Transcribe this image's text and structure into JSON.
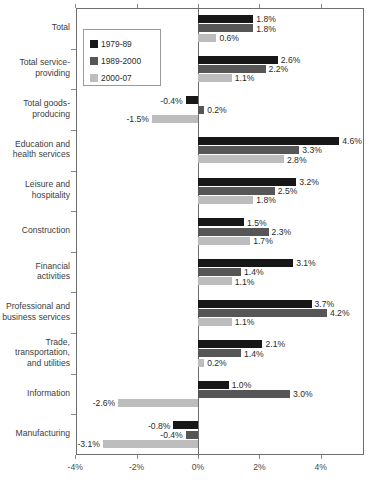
{
  "chart_data": {
    "type": "bar",
    "orientation": "horizontal",
    "title": "",
    "subtitle": "",
    "xlabel": "",
    "ylabel": "",
    "xlim": [
      -4.6,
      5.0
    ],
    "xticks": [
      -4,
      -2,
      0,
      2,
      4
    ],
    "xtick_labels": [
      "-4%",
      "-2%",
      "0%",
      "2%",
      "4%"
    ],
    "grid": false,
    "legend_position": "upper-left-inside",
    "value_suffix": "%",
    "categories": [
      "Total",
      "Total service-\nproviding",
      "Total goods-\nproducing",
      "Education and\nhealth services",
      "Leisure and\nhospitality",
      "Construction",
      "Financial\nactivities",
      "Professional and\nbusiness services",
      "Trade,\ntransportation,\nand utilities",
      "Information",
      "Manufacturing"
    ],
    "series": [
      {
        "name": "1979-89",
        "color": "#171717",
        "values": [
          1.8,
          2.6,
          -0.4,
          4.6,
          3.2,
          1.5,
          3.1,
          3.7,
          2.1,
          1.0,
          -0.8
        ]
      },
      {
        "name": "1989-2000",
        "color": "#565656",
        "values": [
          1.8,
          2.2,
          0.2,
          3.3,
          2.5,
          2.3,
          1.4,
          4.2,
          1.4,
          3.0,
          -0.4
        ]
      },
      {
        "name": "2000-07",
        "color": "#bdbdbd",
        "values": [
          0.6,
          1.1,
          -1.5,
          2.8,
          1.8,
          1.7,
          1.1,
          1.1,
          0.2,
          -2.6,
          -3.1
        ]
      }
    ],
    "value_labels": [
      [
        "1.8%",
        "1.8%",
        "0.6%"
      ],
      [
        "2.6%",
        "2.2%",
        "1.1%"
      ],
      [
        "-0.4%",
        "0.2%",
        "-1.5%"
      ],
      [
        "4.6%",
        "3.3%",
        "2.8%"
      ],
      [
        "3.2%",
        "2.5%",
        "1.8%"
      ],
      [
        "1.5%",
        "2.3%",
        "1.7%"
      ],
      [
        "3.1%",
        "1.4%",
        "1.1%"
      ],
      [
        "3.7%",
        "4.2%",
        "1.1%"
      ],
      [
        "2.1%",
        "1.4%",
        "0.2%"
      ],
      [
        "1.0%",
        "3.0%",
        "-2.6%"
      ],
      [
        "-0.8%",
        "-0.4%",
        "-3.1%"
      ]
    ]
  },
  "legend": {
    "items": [
      {
        "label": "1979-89",
        "swatch": "legend-swatch-1979-89"
      },
      {
        "label": "1989-2000",
        "swatch": "legend-swatch-1989-2000"
      },
      {
        "label": "2000-07",
        "swatch": "legend-swatch-2000-07"
      }
    ]
  },
  "colors": {
    "series_1": "#171717",
    "series_2": "#565656",
    "series_3": "#bdbdbd",
    "frame": "#6e6e6e",
    "text": "#3a3a3a",
    "background": "#ffffff"
  },
  "caption": ""
}
